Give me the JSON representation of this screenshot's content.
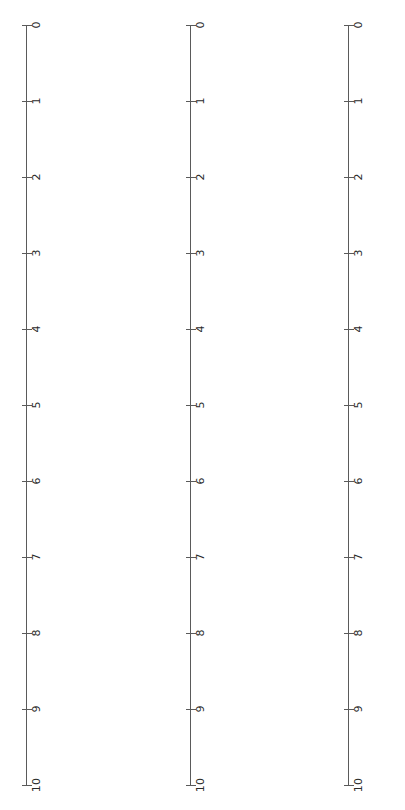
{
  "figure": {
    "background_color": "#ffffff",
    "line_color": "#5a5a5a",
    "text_color": "#2b2b2b",
    "rotation": "labels rotated 90 degrees clockwise",
    "panel_count": 3
  },
  "axes": [
    {
      "name": "axis-left",
      "spine_x": 26,
      "ticks": [
        "0",
        "1",
        "2",
        "3",
        "4",
        "5",
        "6",
        "7",
        "8",
        "9",
        "10"
      ]
    },
    {
      "name": "axis-middle",
      "spine_x": 190,
      "ticks": [
        "0",
        "1",
        "2",
        "3",
        "4",
        "5",
        "6",
        "7",
        "8",
        "9",
        "10"
      ]
    },
    {
      "name": "axis-right",
      "spine_x": 348,
      "ticks": [
        "0",
        "1",
        "2",
        "3",
        "4",
        "5",
        "6",
        "7",
        "8",
        "9",
        "10"
      ]
    }
  ],
  "chart_data": {
    "type": "line",
    "title": "",
    "subtitle": "",
    "xlabel": "",
    "ylabel": "",
    "grid": false,
    "legend": null,
    "orientation": "vertical axes, tick labels rotated 90 degrees clockwise",
    "panels": [
      {
        "name": "axis-left",
        "axis": {
          "tick_values": [
            0,
            1,
            2,
            3,
            4,
            5,
            6,
            7,
            8,
            9,
            10
          ],
          "tick_labels": [
            "0",
            "1",
            "2",
            "3",
            "4",
            "5",
            "6",
            "7",
            "8",
            "9",
            "10"
          ],
          "range": [
            0,
            10
          ],
          "tick_step": 1
        },
        "series": []
      },
      {
        "name": "axis-middle",
        "axis": {
          "tick_values": [
            0,
            1,
            2,
            3,
            4,
            5,
            6,
            7,
            8,
            9,
            10
          ],
          "tick_labels": [
            "0",
            "1",
            "2",
            "3",
            "4",
            "5",
            "6",
            "7",
            "8",
            "9",
            "10"
          ],
          "range": [
            0,
            10
          ],
          "tick_step": 1
        },
        "series": []
      },
      {
        "name": "axis-right",
        "axis": {
          "tick_values": [
            0,
            1,
            2,
            3,
            4,
            5,
            6,
            7,
            8,
            9,
            10
          ],
          "tick_labels": [
            "0",
            "1",
            "2",
            "3",
            "4",
            "5",
            "6",
            "7",
            "8",
            "9",
            "10"
          ],
          "range": [
            0,
            10
          ],
          "tick_step": 1
        },
        "series": []
      }
    ]
  }
}
